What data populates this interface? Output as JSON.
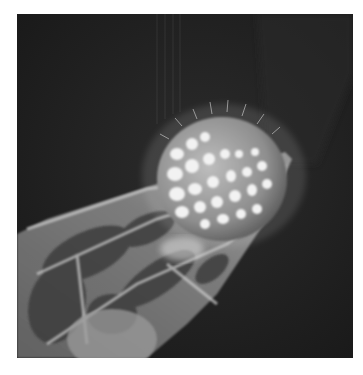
{
  "image": {
    "kind": "scanning-electron-micrograph",
    "subject": "spiky reticulate pollen grain resting on the tip of a plant tissue structure",
    "palette": {
      "background": "#1e1e1e",
      "page": "#ffffff",
      "grain_highlight": "#f2f2f2",
      "tissue_mid": "#8a8a8a",
      "tissue_dark": "#3a3a3a"
    },
    "frame": {
      "x": 17,
      "y": 14,
      "width": 336,
      "height": 344
    }
  }
}
